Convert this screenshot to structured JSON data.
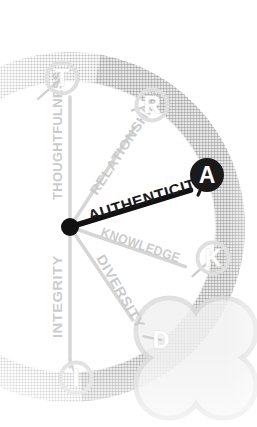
{
  "diagram": {
    "type": "radial-values-wheel",
    "background_color": "#ffffff",
    "highlight_color": "#1a1a1a",
    "faded_color": "#c9c9c9",
    "ring_color": "#d6d6d6",
    "ring_color_dark": "#bdbdbd",
    "hub": {
      "label": "",
      "x": 70,
      "y": 227,
      "radius": 9,
      "color": "#111111"
    },
    "ring": {
      "center_x": 70,
      "center_y": 227,
      "radius": 160,
      "band_width": 30,
      "cropped_left": true
    },
    "clover": {
      "name": "four-petal-clover",
      "center_x": 196,
      "center_y": 358,
      "petal_radius": 33,
      "stroke": "#dcdcdc",
      "fill": "#f1f1f1"
    },
    "nodes": [
      {
        "letter": "T",
        "name": "node-t",
        "angle_deg": -104,
        "x": 62,
        "y": 78,
        "highlight": false,
        "shape": "circle"
      },
      {
        "letter": "R",
        "name": "node-r",
        "angle_deg": -62,
        "x": 152,
        "y": 105,
        "highlight": false,
        "shape": "circle"
      },
      {
        "letter": "A",
        "name": "node-a",
        "angle_deg": -14,
        "x": 207,
        "y": 175,
        "highlight": true,
        "shape": "circle"
      },
      {
        "letter": "K",
        "name": "node-k",
        "angle_deg": 22,
        "x": 213,
        "y": 258,
        "highlight": false,
        "shape": "circle"
      },
      {
        "letter": "D",
        "name": "node-d",
        "angle_deg": 56,
        "x": 161,
        "y": 340,
        "highlight": false,
        "shape": "clover-petal"
      },
      {
        "letter": "I",
        "name": "node-i",
        "angle_deg": 90,
        "x": 76,
        "y": 378,
        "highlight": false,
        "shape": "circle"
      }
    ],
    "spokes": [
      {
        "label": "THOUGHTFULNESS",
        "name": "spoke-thoughtfulness",
        "letter": "T",
        "angle_deg": -90,
        "highlight": false,
        "text_rotation": -90,
        "label_x": 62,
        "label_y": 200,
        "length": 130,
        "stroke": "#cfcfcf",
        "stroke_width": 3.5
      },
      {
        "label": "RELATIONSHIPS",
        "name": "spoke-relationships",
        "letter": "R",
        "angle_deg": -57,
        "highlight": false,
        "text_rotation": -57,
        "label_x": 97,
        "label_y": 196,
        "length": 118,
        "stroke": "#cfcfcf",
        "stroke_width": 3.5
      },
      {
        "label": "AUTHENTICITY",
        "name": "spoke-authenticity",
        "letter": "A",
        "angle_deg": -17,
        "highlight": true,
        "text_rotation": -17,
        "label_x": 90,
        "label_y": 221,
        "length": 126,
        "stroke": "#111111",
        "stroke_width": 5.5
      },
      {
        "label": "KNOWLEDGE",
        "name": "spoke-knowledge",
        "letter": "K",
        "angle_deg": 19,
        "highlight": false,
        "text_rotation": 19,
        "label_x": 100,
        "label_y": 236,
        "length": 122,
        "stroke": "#cfcfcf",
        "stroke_width": 3.5
      },
      {
        "label": "DIVERSITY",
        "name": "spoke-diversity",
        "letter": "D",
        "angle_deg": 56,
        "highlight": false,
        "text_rotation": 60,
        "label_x": 96,
        "label_y": 258,
        "length": 112,
        "stroke": "#cfcfcf",
        "stroke_width": 3.5
      },
      {
        "label": "INTEGRITY",
        "name": "spoke-integrity",
        "letter": "I",
        "angle_deg": 90,
        "highlight": false,
        "text_rotation": -90,
        "label_x": 62,
        "label_y": 338,
        "length": 140,
        "stroke": "#cfcfcf",
        "stroke_width": 3.5
      }
    ],
    "acronym": "TRAKDI"
  }
}
